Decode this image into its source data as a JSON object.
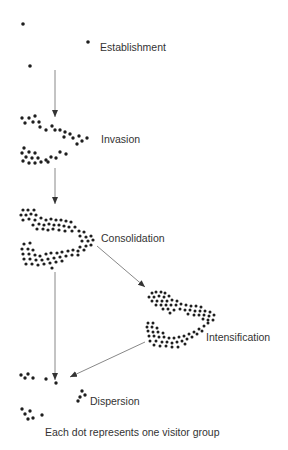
{
  "stages": [
    {
      "id": "establishment",
      "label": "Establishment",
      "x": 100,
      "y": 47
    },
    {
      "id": "invasion",
      "label": "Invasion",
      "x": 103,
      "y": 134
    },
    {
      "id": "consolidation",
      "label": "Consolidation",
      "x": 102,
      "y": 236
    },
    {
      "id": "intensification",
      "label": "Intensification",
      "x": 207,
      "y": 331
    },
    {
      "id": "dispersion",
      "label": "Dispersion",
      "x": 91,
      "y": 399
    }
  ],
  "caption": "Each dot represents one visitor group",
  "colors": {
    "dot": "#1e1e1e",
    "arrow": "#666666",
    "text": "#333333"
  }
}
